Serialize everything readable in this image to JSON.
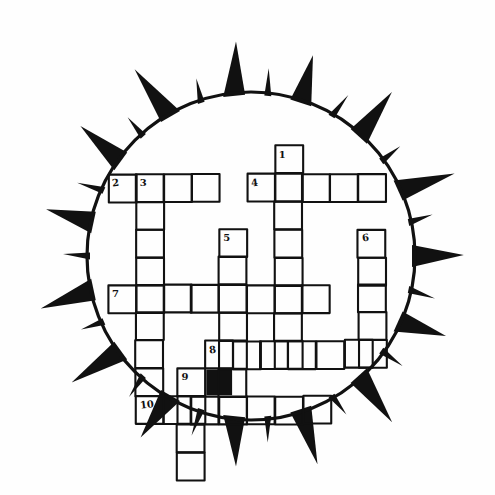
{
  "puzzle": {
    "kind": "crossword-grid",
    "title_visible": false,
    "frame_shape": "sun-starburst",
    "cell_size": 27.8,
    "grid_origin": {
      "x": 108.0,
      "y": 146.0
    },
    "colors": {
      "ink": "#111111",
      "paper": "#fefefe",
      "blocked_cell": "#111111",
      "ray_fill": "#111111"
    },
    "sun": {
      "center_x": 251,
      "center_y": 256,
      "radius": 164,
      "ring_stroke": 3.2,
      "ray_count": 30,
      "long_ray_length": 54,
      "short_ray_length": 26,
      "long_ray_half_width": 11,
      "short_ray_half_width": 3.5,
      "rotation_offset_deg": -96
    },
    "numbers": [
      {
        "label": "1",
        "col": 6,
        "row": 0
      },
      {
        "label": "2",
        "col": 0,
        "row": 1
      },
      {
        "label": "3",
        "col": 1,
        "row": 1
      },
      {
        "label": "4",
        "col": 5,
        "row": 1
      },
      {
        "label": "5",
        "col": 4,
        "row": 3
      },
      {
        "label": "6",
        "col": 9,
        "row": 3
      },
      {
        "label": "7",
        "col": 0,
        "row": 5
      },
      {
        "label": "8",
        "col": 3.5,
        "row": 7
      },
      {
        "label": "9",
        "col": 2.5,
        "row": 8
      },
      {
        "label": "10",
        "col": 1,
        "row": 9
      }
    ],
    "blocked_cells": [
      {
        "col": 3.5,
        "row": 8
      }
    ],
    "across_entries": [
      {
        "number": "2",
        "row": 1,
        "start_col": 0,
        "length": 4
      },
      {
        "number": "4",
        "row": 1,
        "start_col": 5,
        "length": 5
      },
      {
        "number": "7",
        "row": 5,
        "start_col": 0,
        "length": 8
      },
      {
        "number": "8",
        "row": 7,
        "start_col": 3.5,
        "length": 6
      },
      {
        "number": "10",
        "row": 9,
        "start_col": 1,
        "length": 7
      }
    ],
    "down_entries": [
      {
        "number": "1",
        "col": 6,
        "start_row": 0,
        "length": 8
      },
      {
        "number": "3",
        "col": 1,
        "start_row": 1,
        "length": 9
      },
      {
        "number": "5",
        "col": 4,
        "start_row": 3,
        "length": 6
      },
      {
        "number": "6",
        "col": 9,
        "start_row": 3,
        "length": 5
      },
      {
        "number": "9",
        "col": 2.5,
        "start_row": 8,
        "length": 4
      }
    ]
  }
}
